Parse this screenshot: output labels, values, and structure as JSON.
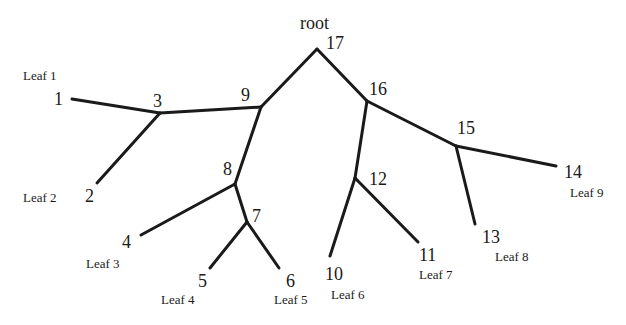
{
  "diagram": {
    "type": "tree",
    "root_label": "root",
    "nodes": [
      {
        "id": "1",
        "leaf_label": "Leaf 1"
      },
      {
        "id": "2",
        "leaf_label": "Leaf 2"
      },
      {
        "id": "3"
      },
      {
        "id": "4",
        "leaf_label": "Leaf 3"
      },
      {
        "id": "5",
        "leaf_label": "Leaf 4"
      },
      {
        "id": "6",
        "leaf_label": "Leaf 5"
      },
      {
        "id": "7"
      },
      {
        "id": "8"
      },
      {
        "id": "9"
      },
      {
        "id": "10",
        "leaf_label": "Leaf 6"
      },
      {
        "id": "11",
        "leaf_label": "Leaf 7"
      },
      {
        "id": "12"
      },
      {
        "id": "13",
        "leaf_label": "Leaf 8"
      },
      {
        "id": "14",
        "leaf_label": "Leaf 9"
      },
      {
        "id": "15"
      },
      {
        "id": "16"
      },
      {
        "id": "17"
      }
    ],
    "edges": [
      [
        "17",
        "9"
      ],
      [
        "17",
        "16"
      ],
      [
        "9",
        "3"
      ],
      [
        "9",
        "8"
      ],
      [
        "3",
        "1"
      ],
      [
        "3",
        "2"
      ],
      [
        "8",
        "4"
      ],
      [
        "8",
        "7"
      ],
      [
        "7",
        "5"
      ],
      [
        "7",
        "6"
      ],
      [
        "16",
        "12"
      ],
      [
        "16",
        "15"
      ],
      [
        "12",
        "10"
      ],
      [
        "12",
        "11"
      ],
      [
        "15",
        "13"
      ],
      [
        "15",
        "14"
      ]
    ],
    "line_color": "#1a1a1a"
  }
}
